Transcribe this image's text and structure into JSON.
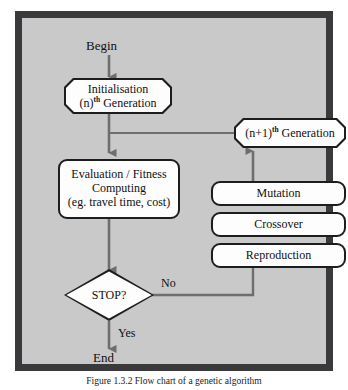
{
  "figure": {
    "caption": "Figure 1.3.2  Flow chart of a genetic algorithm",
    "frame_color": "#3a3a3c",
    "background_color": "#c9c9c9",
    "node_fill": "#fdfdfd",
    "line_color": "#6e6e6e"
  },
  "diagram": {
    "type": "flowchart",
    "terminals": {
      "begin": "Begin",
      "end": "End"
    },
    "nodes": {
      "initialisation": {
        "shape": "octagon",
        "line1": "Initialisation",
        "line2_pre": "(n)",
        "line2_sup": "th",
        "line2_post": " Generation"
      },
      "evaluation": {
        "shape": "rounded-rect",
        "line1": "Evaluation / Fitness",
        "line2": "Computing",
        "line3": "(eg. travel time, cost)"
      },
      "next_generation": {
        "shape": "octagon",
        "pre": "(n+1)",
        "sup": "th",
        "post": " Generation"
      },
      "mutation": {
        "shape": "rounded-rect",
        "label": "Mutation"
      },
      "crossover": {
        "shape": "rounded-rect",
        "label": "Crossover"
      },
      "reproduction": {
        "shape": "rounded-rect",
        "label": "Reproduction"
      },
      "stop": {
        "shape": "diamond",
        "label": "STOP?"
      }
    },
    "edge_labels": {
      "no": "No",
      "yes": "Yes"
    },
    "edges": [
      {
        "from": "begin",
        "to": "initialisation",
        "label": ""
      },
      {
        "from": "initialisation",
        "to": "evaluation",
        "label": ""
      },
      {
        "from": "next_generation",
        "to": "evaluation",
        "label": ""
      },
      {
        "from": "evaluation",
        "to": "stop",
        "label": ""
      },
      {
        "from": "stop",
        "to": "reproduction",
        "label": "No"
      },
      {
        "from": "stop",
        "to": "end",
        "label": "Yes"
      },
      {
        "from": "mutation",
        "to": "next_generation",
        "label": ""
      }
    ]
  }
}
